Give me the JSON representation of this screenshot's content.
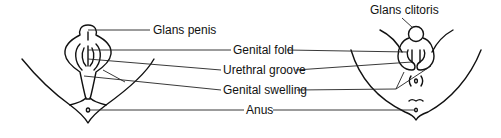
{
  "diagram": {
    "type": "anatomical-labeled-diagram",
    "panels": [
      {
        "id": "male",
        "labels": [
          "Glans penis"
        ]
      },
      {
        "id": "female",
        "labels": [
          "Glans clitoris"
        ]
      }
    ],
    "labels": {
      "glans_penis": "Glans penis",
      "glans_clitoris": "Glans clitoris",
      "genital_fold": "Genital fold",
      "urethral_groove": "Urethral groove",
      "genital_swelling": "Genital swelling",
      "anus": "Anus"
    },
    "colors": {
      "line": "#111111",
      "background": "#ffffff"
    }
  }
}
